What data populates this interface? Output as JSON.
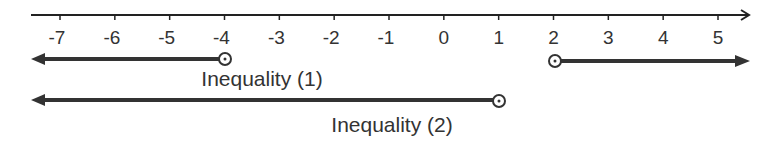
{
  "diagram": {
    "type": "number-line",
    "axis": {
      "min": -7,
      "max": 5,
      "ticks": [
        -7,
        -6,
        -5,
        -4,
        -3,
        -2,
        -1,
        0,
        1,
        2,
        3,
        4,
        5
      ],
      "tick_labels": [
        "-7",
        "-6",
        "-5",
        "-4",
        "-3",
        "-2",
        "-1",
        "0",
        "1",
        "2",
        "3",
        "4",
        "5"
      ],
      "arrow_right": true
    },
    "inequalities": [
      {
        "label": "Inequality (1)",
        "rays": [
          {
            "endpoint": -4,
            "endpoint_type": "open",
            "direction": "left"
          },
          {
            "endpoint": 2,
            "endpoint_type": "open",
            "direction": "right"
          }
        ]
      },
      {
        "label": "Inequality (2)",
        "rays": [
          {
            "endpoint": 1,
            "endpoint_type": "open",
            "direction": "left"
          }
        ]
      }
    ],
    "colors": {
      "axis": "#222222",
      "ray": "#333333",
      "text": "#333333"
    }
  }
}
